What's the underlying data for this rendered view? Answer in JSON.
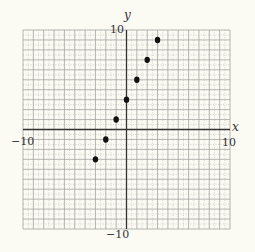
{
  "chart_data": {
    "type": "scatter",
    "title": "",
    "xlabel": "x",
    "ylabel": "y",
    "xlim": [
      -10,
      10
    ],
    "ylim": [
      -10,
      10
    ],
    "grid": true,
    "tick_labels": {
      "x_min": "−10",
      "x_max": "10",
      "y_min": "−10",
      "y_max": "10"
    },
    "series": [
      {
        "name": "points",
        "x": [
          -3,
          -2,
          -1,
          0,
          1,
          2,
          3
        ],
        "y": [
          -3,
          -1,
          1,
          3,
          5,
          7,
          9
        ]
      }
    ]
  },
  "colors": {
    "background": "#fbfaf3",
    "grid": "#9a9a9a",
    "axis": "#333333",
    "point": "#111111"
  }
}
